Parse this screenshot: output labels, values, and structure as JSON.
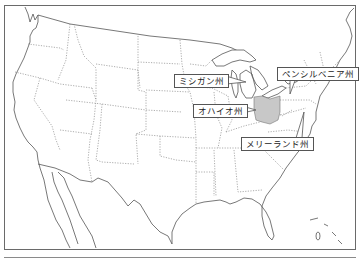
{
  "map": {
    "title": "",
    "region": "United States (contiguous)",
    "highlight_color": "#c8c8c8",
    "highlighted_state": "ohio",
    "labels": [
      {
        "id": "michigan",
        "text": "ミシガン州"
      },
      {
        "id": "pennsylvania",
        "text": "ペンシルベニア州"
      },
      {
        "id": "ohio",
        "text": "オハイオ州"
      },
      {
        "id": "maryland",
        "text": "メリーランド州"
      }
    ]
  }
}
